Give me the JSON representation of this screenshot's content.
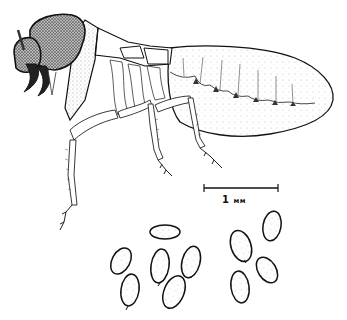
{
  "figure": {
    "scale_bar": {
      "value": "1",
      "unit": "мм"
    },
    "fecal_pellets": {
      "count": 11
    },
    "colors": {
      "ink": "#111111",
      "background": "#ffffff",
      "stipple": "#555555"
    }
  }
}
